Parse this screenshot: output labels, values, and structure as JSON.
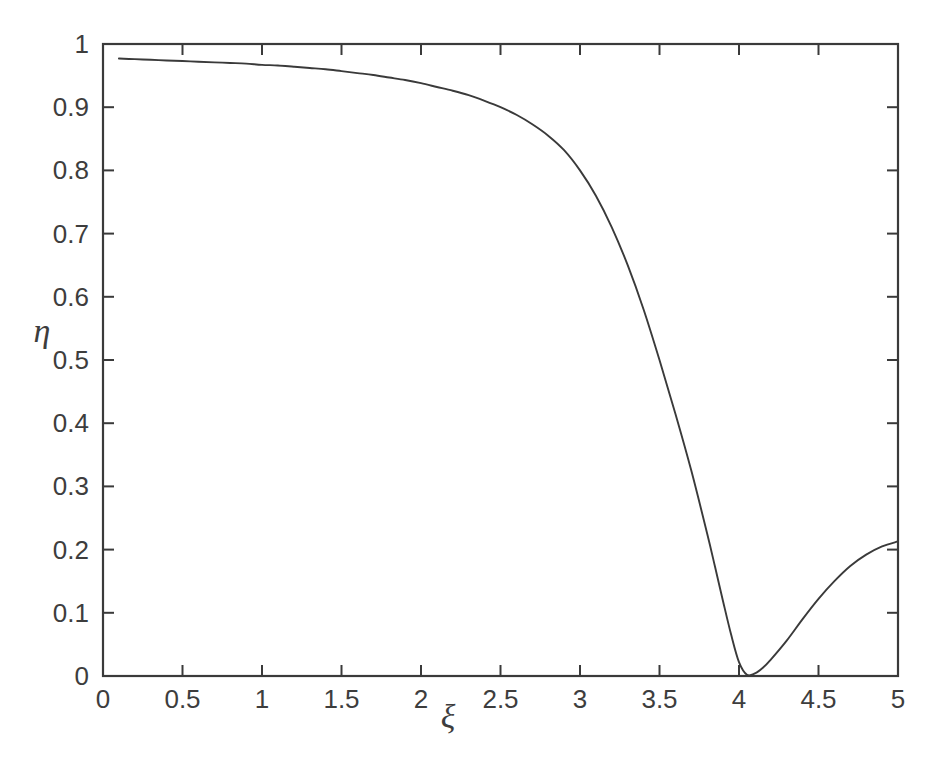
{
  "figure": {
    "background_color": "#ffffff",
    "line_color": "#3a3a3a",
    "axis_color": "#3a3a3a",
    "text_color": "#3d3d3d"
  },
  "axis_labels": {
    "x": "ξ",
    "y": "η"
  },
  "xticklabels": [
    "0",
    "0.5",
    "1",
    "1.5",
    "2",
    "2.5",
    "3",
    "3.5",
    "4",
    "4.5",
    "5"
  ],
  "yticklabels": [
    "0",
    "0.1",
    "0.2",
    "0.3",
    "0.4",
    "0.5",
    "0.6",
    "0.7",
    "0.8",
    "0.9",
    "1"
  ],
  "chart_data": {
    "type": "line",
    "title": "",
    "subtitle": "",
    "xlabel": "ξ",
    "ylabel": "η",
    "xlim": [
      0,
      5
    ],
    "ylim": [
      0,
      1
    ],
    "xticks": [
      0,
      0.5,
      1,
      1.5,
      2,
      2.5,
      3,
      3.5,
      4,
      4.5,
      5
    ],
    "yticks": [
      0,
      0.1,
      0.2,
      0.3,
      0.4,
      0.5,
      0.6,
      0.7,
      0.8,
      0.9,
      1
    ],
    "grid": false,
    "legend": null,
    "legend_position": "none",
    "annotations": [],
    "series": [
      {
        "name": "eta",
        "color": "#3a3a3a",
        "linewidth": 1.9,
        "x": [
          0.1,
          0.2,
          0.3,
          0.4,
          0.5,
          0.6,
          0.7,
          0.8,
          0.9,
          1.0,
          1.1,
          1.2,
          1.3,
          1.4,
          1.5,
          1.6,
          1.7,
          1.8,
          1.9,
          2.0,
          2.1,
          2.2,
          2.3,
          2.4,
          2.5,
          2.6,
          2.7,
          2.8,
          2.9,
          3.0,
          3.1,
          3.2,
          3.3,
          3.4,
          3.5,
          3.6,
          3.7,
          3.8,
          3.85,
          3.9,
          3.95,
          4.0,
          4.05,
          4.1,
          4.15,
          4.2,
          4.3,
          4.4,
          4.5,
          4.6,
          4.7,
          4.8,
          4.9,
          5.0
        ],
        "y": [
          0.977,
          0.976,
          0.975,
          0.974,
          0.973,
          0.972,
          0.971,
          0.97,
          0.969,
          0.967,
          0.966,
          0.964,
          0.962,
          0.96,
          0.957,
          0.954,
          0.951,
          0.947,
          0.943,
          0.938,
          0.932,
          0.926,
          0.919,
          0.91,
          0.9,
          0.888,
          0.873,
          0.855,
          0.832,
          0.8,
          0.76,
          0.71,
          0.65,
          0.58,
          0.5,
          0.415,
          0.325,
          0.225,
          0.172,
          0.118,
          0.066,
          0.022,
          0.002,
          0.004,
          0.013,
          0.026,
          0.056,
          0.09,
          0.122,
          0.15,
          0.174,
          0.192,
          0.205,
          0.213
        ]
      }
    ]
  }
}
